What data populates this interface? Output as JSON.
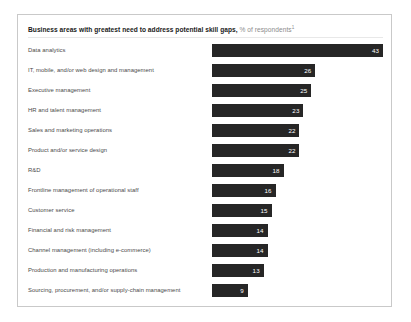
{
  "exhibit": {
    "title_main": "Business areas with greatest need to address potential skill gaps,",
    "title_sub": "% of respondents",
    "footnote_marker": "1"
  },
  "chart_data": {
    "type": "bar",
    "orientation": "horizontal",
    "title": "Business areas with greatest need to address potential skill gaps, % of respondents",
    "xlabel": "",
    "ylabel": "",
    "xlim": [
      0,
      43
    ],
    "grid": false,
    "legend": false,
    "value_labels": true,
    "bar_color": "#262626",
    "categories": [
      "Data analytics",
      "IT, mobile, and/or web design and management",
      "Executive management",
      "HR and talent management",
      "Sales and marketing operations",
      "Product and/or service design",
      "R&D",
      "Frontline management of operational staff",
      "Customer service",
      "Financial and risk management",
      "Channel management (including e-commerce)",
      "Production and manufacturing operations",
      "Sourcing, procurement, and/or supply-chain management"
    ],
    "values": [
      43,
      26,
      25,
      23,
      22,
      22,
      18,
      16,
      15,
      14,
      14,
      13,
      9
    ],
    "value_labels_text": [
      "43",
      "26",
      "25",
      "23",
      "22",
      "22",
      "18",
      "16",
      "15",
      "14",
      "14",
      "13",
      "9"
    ]
  }
}
